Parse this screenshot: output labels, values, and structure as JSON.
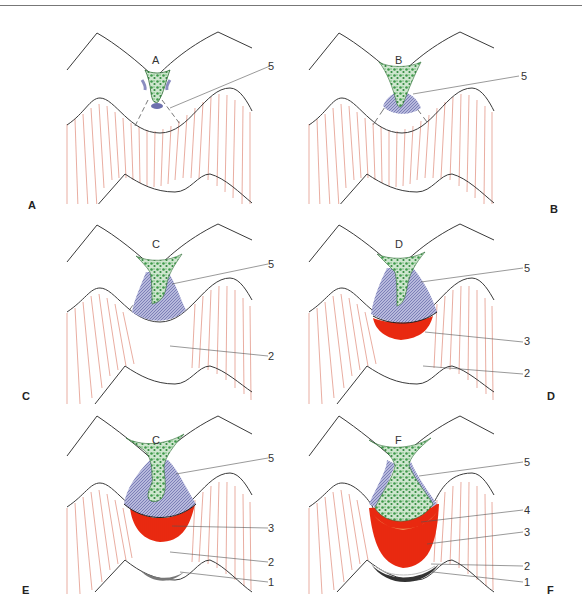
{
  "figure": {
    "panels": [
      {
        "id": "A",
        "corner_label": "A",
        "inner_label": "A",
        "callouts": [
          "5"
        ]
      },
      {
        "id": "B",
        "corner_label": "B",
        "inner_label": "B",
        "callouts": [
          "5"
        ]
      },
      {
        "id": "C",
        "corner_label": "C",
        "inner_label": "C",
        "callouts": [
          "5",
          "2"
        ]
      },
      {
        "id": "D",
        "corner_label": "D",
        "inner_label": "D",
        "callouts": [
          "5",
          "3",
          "2"
        ]
      },
      {
        "id": "E",
        "corner_label": "E",
        "inner_label": "C",
        "callouts": [
          "5",
          "3",
          "2",
          "1"
        ]
      },
      {
        "id": "F",
        "corner_label": "F",
        "inner_label": "F",
        "callouts": [
          "5",
          "4",
          "3",
          "2",
          "1"
        ]
      }
    ],
    "colors": {
      "outline": "#3a3a3a",
      "hatch": "#e08a78",
      "green": "#3e9a4a",
      "blue_hatch": "#7d80b8",
      "red": "#ee2a10",
      "orange": "#f0a060"
    }
  }
}
